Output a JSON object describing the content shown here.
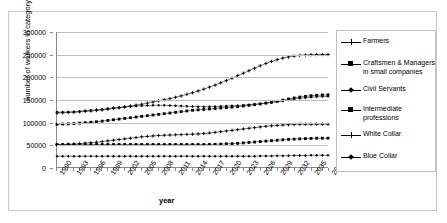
{
  "clipped_title_text": "",
  "chart_data": {
    "type": "line",
    "title": "",
    "xlabel": "year",
    "ylabel": "number of workers in category",
    "xlim": [
      1990,
      2038
    ],
    "ylim": [
      0,
      300000
    ],
    "ytick_labels": [
      "300000",
      "250000",
      "200000",
      "150000",
      "100000",
      "50000",
      "0"
    ],
    "ytick_values": [
      300000,
      250000,
      200000,
      150000,
      100000,
      50000,
      0
    ],
    "ytick_step": 50000,
    "grid": true,
    "legend_position": "right",
    "x": [
      1990,
      1991,
      1992,
      1993,
      1994,
      1995,
      1996,
      1997,
      1998,
      1999,
      2000,
      2001,
      2002,
      2003,
      2004,
      2005,
      2006,
      2007,
      2008,
      2009,
      2010,
      2011,
      2012,
      2013,
      2014,
      2015,
      2016,
      2017,
      2018,
      2019,
      2020,
      2021,
      2022,
      2023,
      2024,
      2025,
      2026,
      2027,
      2028,
      2029,
      2030,
      2031,
      2032,
      2033,
      2034,
      2035,
      2036,
      2037,
      2038
    ],
    "xtick_labels": [
      "1990",
      "1993",
      "1996",
      "1999",
      "2002",
      "2005",
      "2008",
      "2011",
      "2014",
      "2017",
      "2020",
      "2023",
      "2026",
      "2029",
      "2032",
      "2035",
      "2038"
    ],
    "xtick_values": [
      1990,
      1993,
      1996,
      1999,
      2002,
      2005,
      2008,
      2011,
      2014,
      2017,
      2020,
      2023,
      2026,
      2029,
      2032,
      2035,
      2038
    ],
    "series": [
      {
        "name": "Farmers",
        "marker": "plus",
        "values": [
          120000,
          120500,
          121000,
          121500,
          122500,
          123500,
          124500,
          125500,
          127000,
          128500,
          130000,
          131500,
          133500,
          135500,
          137500,
          139500,
          142000,
          144500,
          147000,
          149500,
          152000,
          155000,
          158000,
          161500,
          165000,
          169000,
          173000,
          177500,
          182000,
          187000,
          192000,
          197500,
          203000,
          208500,
          214000,
          219500,
          225000,
          230000,
          234500,
          238500,
          242000,
          244500,
          246500,
          248000,
          249000,
          249500,
          250000,
          250000,
          250000
        ]
      },
      {
        "name": "Craftsmen & Managers in small companies",
        "marker": "square",
        "values": [
          95000,
          95500,
          96000,
          96500,
          97500,
          98500,
          99500,
          100500,
          102000,
          103500,
          105000,
          106500,
          108000,
          109500,
          111000,
          112500,
          114000,
          115500,
          117000,
          118500,
          120000,
          121500,
          123000,
          124500,
          126000,
          127000,
          128000,
          129000,
          130000,
          131000,
          132000,
          133000,
          134000,
          135500,
          137000,
          138500,
          140000,
          142000,
          144000,
          146000,
          148500,
          151000,
          153500,
          155500,
          157000,
          158500,
          159500,
          160000,
          160500
        ]
      },
      {
        "name": "Civil Servants",
        "marker": "diamond",
        "values": [
          122000,
          122000,
          122500,
          123000,
          124000,
          125000,
          126000,
          127000,
          128500,
          130000,
          131500,
          132500,
          133500,
          134500,
          135500,
          136000,
          136500,
          137000,
          137000,
          137000,
          136500,
          136000,
          135500,
          135000,
          134500,
          134000,
          134000,
          134000,
          134500,
          135000,
          135500,
          136000,
          136500,
          137500,
          138500,
          139500,
          140500,
          142000,
          143500,
          145000,
          147000,
          149000,
          151000,
          152500,
          154000,
          155000,
          156000,
          156500,
          157000
        ]
      },
      {
        "name": "Intermediate professions",
        "marker": "square",
        "values": [
          50000,
          50000,
          50000,
          50000,
          50000,
          50000,
          50000,
          50000,
          50000,
          50000,
          50000,
          50000,
          50000,
          50000,
          50000,
          50000,
          50000,
          50000,
          50000,
          50000,
          50000,
          50000,
          50000,
          50000,
          50000,
          50000,
          50000,
          50000,
          50500,
          51000,
          51500,
          52000,
          52500,
          53500,
          54500,
          55500,
          56500,
          57500,
          58500,
          59500,
          60500,
          61500,
          62000,
          62500,
          63000,
          63500,
          64000,
          64000,
          64000
        ]
      },
      {
        "name": "White Collar",
        "marker": "plus",
        "values": [
          50000,
          50000,
          50500,
          51000,
          52000,
          53000,
          54000,
          55000,
          56500,
          58000,
          59500,
          61000,
          62500,
          64000,
          65500,
          67000,
          68000,
          69000,
          70000,
          70500,
          71000,
          71500,
          72000,
          72500,
          73000,
          73500,
          74500,
          75500,
          77000,
          78500,
          80000,
          81500,
          83000,
          84500,
          86000,
          87500,
          89000,
          90500,
          91500,
          92500,
          93500,
          94000,
          94500,
          95000,
          95000,
          95000,
          95000,
          95000,
          95000
        ]
      },
      {
        "name": "Blue Collar",
        "marker": "diamond",
        "values": [
          24000,
          24000,
          24000,
          24000,
          24000,
          24000,
          24000,
          24000,
          24000,
          24000,
          24000,
          24000,
          24000,
          24000,
          24000,
          24000,
          24000,
          24000,
          24000,
          24000,
          24000,
          24000,
          24000,
          24000,
          24000,
          24000,
          24000,
          24000,
          24000,
          24000,
          24000,
          24000,
          24000,
          24000,
          24000,
          24000,
          24500,
          24500,
          24500,
          25000,
          25000,
          25000,
          25500,
          25500,
          25500,
          26000,
          26000,
          26000,
          26000
        ]
      }
    ]
  }
}
